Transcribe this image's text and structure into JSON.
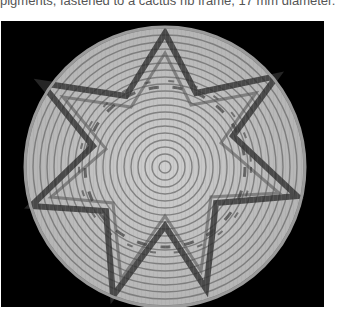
{
  "caption": {
    "text": "pigments, fastened to a cactus rib frame, 17 mm diameter."
  },
  "figure": {
    "background_color": "#000000",
    "basket_color_light": "#d8d8d8",
    "basket_color_dark": "#3a3a3a"
  }
}
